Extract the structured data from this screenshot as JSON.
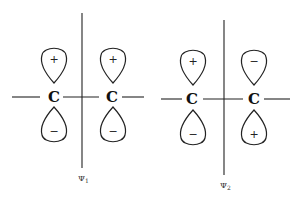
{
  "diagrams": [
    {
      "label": "Ψ",
      "subscript": "1",
      "atoms": [
        "C",
        "C"
      ],
      "upper_lobes": [
        "+",
        "+"
      ],
      "lower_lobes": [
        "−",
        "−"
      ]
    },
    {
      "label": "Ψ",
      "subscript": "2",
      "atoms": [
        "C",
        "C"
      ],
      "upper_lobes": [
        "+",
        "−"
      ],
      "lower_lobes": [
        "−",
        "+"
      ]
    }
  ],
  "colors": {
    "stroke": "#222222",
    "background": "#ffffff"
  }
}
